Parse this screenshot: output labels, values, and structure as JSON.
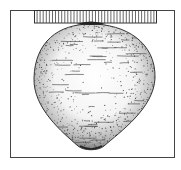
{
  "figure": {
    "colors": {
      "background": "#ffffff",
      "line": "#333333",
      "stipple": "#555555"
    },
    "frame": {
      "x": 10,
      "y": 10,
      "width": 165,
      "height": 148
    },
    "bar": {
      "x": 34,
      "y": 10,
      "width": 123,
      "height": 13,
      "hatch_count": 40
    },
    "body": {
      "top": 24,
      "bottom": 150,
      "left": 34,
      "right": 155,
      "tip_x": 91
    }
  }
}
